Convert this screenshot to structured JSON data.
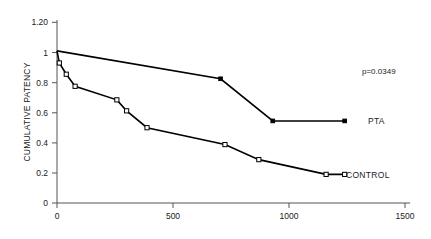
{
  "chart_data": {
    "type": "line",
    "title": "",
    "subtitle": "",
    "xlabel": "",
    "ylabel": "CUMULATIVE PATENCY",
    "xlim": [
      0,
      1500
    ],
    "ylim": [
      0,
      1.2
    ],
    "grid": false,
    "legend_position": "right-of-plot-inline",
    "xticks": [
      0,
      500,
      1000,
      1500
    ],
    "xtick_labels": [
      "0",
      "500",
      "1000",
      "1500"
    ],
    "yticks": [
      0,
      0.2,
      0.4,
      0.6,
      0.8,
      1.0,
      1.2
    ],
    "ytick_labels": [
      "0",
      "0.2",
      "0.4",
      "0.6",
      "0.8",
      "1",
      "1.20"
    ],
    "annotations": [
      {
        "text": "p=0.0349",
        "x": 1320,
        "y": 0.875
      }
    ],
    "series": [
      {
        "name": "PTA",
        "label": "PTA",
        "marker": "filled-square",
        "points": [
          {
            "x": 0,
            "y": 1.01
          },
          {
            "x": 705,
            "y": 0.825
          },
          {
            "x": 930,
            "y": 0.545
          },
          {
            "x": 1240,
            "y": 0.545
          }
        ]
      },
      {
        "name": "CONTROL",
        "label": "CONTROL",
        "marker": "open-square",
        "points": [
          {
            "x": 0,
            "y": 1.01
          },
          {
            "x": 10,
            "y": 0.93
          },
          {
            "x": 40,
            "y": 0.855
          },
          {
            "x": 78,
            "y": 0.775
          },
          {
            "x": 258,
            "y": 0.685
          },
          {
            "x": 300,
            "y": 0.612
          },
          {
            "x": 388,
            "y": 0.5
          },
          {
            "x": 724,
            "y": 0.388
          },
          {
            "x": 870,
            "y": 0.288
          },
          {
            "x": 1160,
            "y": 0.19
          },
          {
            "x": 1240,
            "y": 0.19
          }
        ]
      }
    ]
  },
  "labels": {
    "pta": "PTA",
    "control": "CONTROL",
    "pvalue": "p=0.0349",
    "y_axis_title": "CUMULATIVE PATENCY",
    "y_1_20": "1.20",
    "y_1": "1",
    "y_0_8": "0.8",
    "y_0_6": "0.6",
    "y_0_4": "0.4",
    "y_0_2": "0.2",
    "y_0": "0",
    "x_0": "0",
    "x_500": "500",
    "x_1000": "1000",
    "x_1500": "1500"
  },
  "colors": {
    "curve": "#000000",
    "axis": "#555555",
    "text": "#1a1a1a",
    "background": "#ffffff"
  }
}
